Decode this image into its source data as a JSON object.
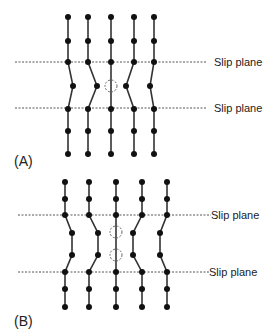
{
  "panels": [
    {
      "label": "(A)",
      "slip_planes": [
        {
          "label": "Slip plane",
          "y": 62,
          "x1": 15,
          "x2": 206,
          "tx": 214
        },
        {
          "label": "Slip plane",
          "y": 108,
          "x1": 15,
          "x2": 206,
          "tx": 214
        }
      ],
      "label_pos": {
        "x": 14,
        "y": 166
      },
      "columns": [
        [
          [
            68,
            17
          ],
          [
            68,
            41
          ],
          [
            68,
            62
          ],
          [
            73,
            86
          ],
          [
            68,
            109
          ],
          [
            68,
            131
          ],
          [
            68,
            154
          ]
        ],
        [
          [
            88,
            17
          ],
          [
            88,
            41
          ],
          [
            88,
            62
          ],
          [
            97,
            86
          ],
          [
            88,
            109
          ],
          [
            88,
            131
          ],
          [
            88,
            154
          ]
        ],
        [
          [
            111,
            17
          ],
          [
            111,
            41
          ],
          [
            111,
            62
          ],
          [
            111,
            109
          ],
          [
            111,
            131
          ],
          [
            111,
            154
          ]
        ],
        [
          [
            134,
            17
          ],
          [
            134,
            41
          ],
          [
            134,
            62
          ],
          [
            126,
            86
          ],
          [
            134,
            109
          ],
          [
            134,
            131
          ],
          [
            134,
            154
          ]
        ],
        [
          [
            154,
            17
          ],
          [
            154,
            41
          ],
          [
            154,
            62
          ],
          [
            150,
            86
          ],
          [
            154,
            109
          ],
          [
            154,
            131
          ],
          [
            154,
            154
          ]
        ]
      ],
      "vacancies": [
        [
          111,
          86
        ]
      ]
    },
    {
      "label": "(B)",
      "slip_planes": [
        {
          "label": "Slip plane",
          "y": 215,
          "x1": 18,
          "x2": 211,
          "tx": 211
        },
        {
          "label": "Slip plane",
          "y": 272,
          "x1": 18,
          "x2": 209,
          "tx": 209
        }
      ],
      "label_pos": {
        "x": 14,
        "y": 326
      },
      "columns": [
        [
          [
            65,
            182
          ],
          [
            65,
            199
          ],
          [
            65,
            215
          ],
          [
            72,
            233
          ],
          [
            72,
            255
          ],
          [
            65,
            272
          ],
          [
            65,
            289
          ],
          [
            65,
            307
          ]
        ],
        [
          [
            89,
            182
          ],
          [
            89,
            199
          ],
          [
            89,
            215
          ],
          [
            98,
            233
          ],
          [
            98,
            255
          ],
          [
            89,
            272
          ],
          [
            89,
            289
          ],
          [
            89,
            307
          ]
        ],
        [
          [
            116,
            182
          ],
          [
            116,
            199
          ],
          [
            116,
            215
          ],
          [
            116,
            272
          ],
          [
            116,
            289
          ],
          [
            116,
            307
          ]
        ],
        [
          [
            142,
            182
          ],
          [
            142,
            199
          ],
          [
            142,
            215
          ],
          [
            133,
            233
          ],
          [
            133,
            255
          ],
          [
            142,
            272
          ],
          [
            142,
            289
          ],
          [
            142,
            307
          ]
        ],
        [
          [
            167,
            182
          ],
          [
            167,
            199
          ],
          [
            167,
            215
          ],
          [
            160,
            233
          ],
          [
            160,
            255
          ],
          [
            167,
            272
          ],
          [
            167,
            289
          ],
          [
            167,
            307
          ]
        ]
      ],
      "vacancies": [
        [
          116,
          232
        ],
        [
          116,
          255
        ]
      ]
    }
  ],
  "style": {
    "atom_color": "#111111",
    "bond_color": "#333333",
    "plane_color": "#555555",
    "vacancy_color": "#666666"
  }
}
